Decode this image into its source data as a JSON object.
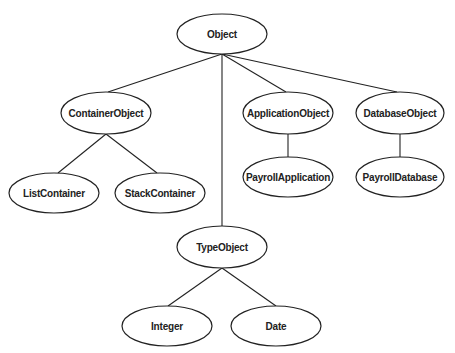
{
  "diagram": {
    "type": "class-hierarchy-tree",
    "nodes": [
      {
        "id": "object",
        "label": "Object",
        "cx": 222,
        "cy": 34,
        "rx": 45,
        "ry": 20
      },
      {
        "id": "container-object",
        "label": "ContainerObject",
        "cx": 106,
        "cy": 113,
        "rx": 45,
        "ry": 21
      },
      {
        "id": "application-object",
        "label": "ApplicationObject",
        "cx": 288,
        "cy": 113,
        "rx": 45,
        "ry": 21
      },
      {
        "id": "database-object",
        "label": "DatabaseObject",
        "cx": 400,
        "cy": 113,
        "rx": 44,
        "ry": 21
      },
      {
        "id": "payroll-application",
        "label": "PayrollApplication",
        "cx": 288,
        "cy": 177,
        "rx": 45,
        "ry": 20
      },
      {
        "id": "payroll-database",
        "label": "PayrollDatabase",
        "cx": 400,
        "cy": 177,
        "rx": 44,
        "ry": 20
      },
      {
        "id": "list-container",
        "label": "ListContainer",
        "cx": 54,
        "cy": 193,
        "rx": 45,
        "ry": 20
      },
      {
        "id": "stack-container",
        "label": "StackContainer",
        "cx": 160,
        "cy": 193,
        "rx": 45,
        "ry": 20
      },
      {
        "id": "type-object",
        "label": "TypeObject",
        "cx": 222,
        "cy": 247,
        "rx": 45,
        "ry": 21
      },
      {
        "id": "integer",
        "label": "Integer",
        "cx": 167,
        "cy": 326,
        "rx": 45,
        "ry": 20
      },
      {
        "id": "date",
        "label": "Date",
        "cx": 276,
        "cy": 326,
        "rx": 45,
        "ry": 20
      }
    ],
    "edges": [
      {
        "from": "object",
        "to": "container-object",
        "x1": 222,
        "y1": 54,
        "x2": 108,
        "y2": 92
      },
      {
        "from": "object",
        "to": "type-object",
        "x1": 222,
        "y1": 54,
        "x2": 222,
        "y2": 226
      },
      {
        "from": "object",
        "to": "application-object",
        "x1": 222,
        "y1": 54,
        "x2": 286,
        "y2": 92
      },
      {
        "from": "object",
        "to": "database-object",
        "x1": 222,
        "y1": 54,
        "x2": 397,
        "y2": 92
      },
      {
        "from": "container-object",
        "to": "list-container",
        "x1": 106,
        "y1": 134,
        "x2": 58,
        "y2": 173
      },
      {
        "from": "container-object",
        "to": "stack-container",
        "x1": 106,
        "y1": 134,
        "x2": 157,
        "y2": 173
      },
      {
        "from": "application-object",
        "to": "payroll-application",
        "x1": 288,
        "y1": 134,
        "x2": 288,
        "y2": 157
      },
      {
        "from": "database-object",
        "to": "payroll-database",
        "x1": 400,
        "y1": 134,
        "x2": 400,
        "y2": 157
      },
      {
        "from": "type-object",
        "to": "integer",
        "x1": 222,
        "y1": 268,
        "x2": 168,
        "y2": 306
      },
      {
        "from": "type-object",
        "to": "date",
        "x1": 222,
        "y1": 268,
        "x2": 276,
        "y2": 306
      }
    ]
  }
}
